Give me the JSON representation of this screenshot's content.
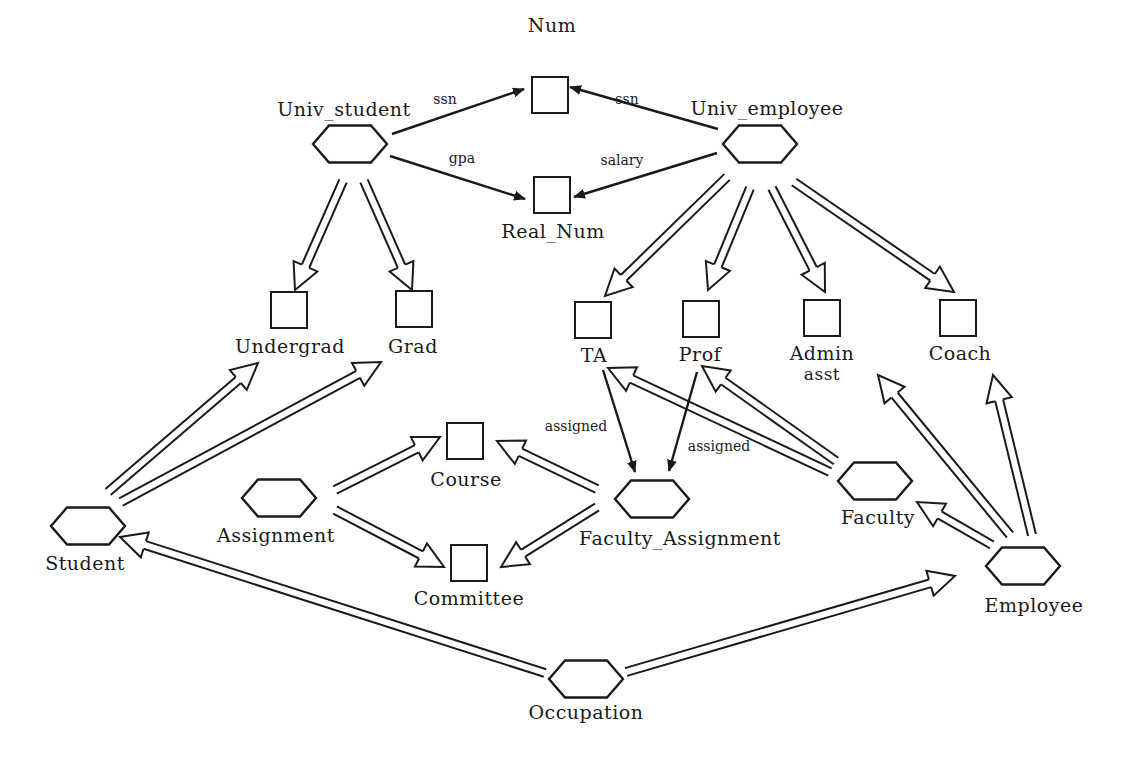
{
  "diagram": {
    "colors": {
      "ink": "#1a1a1a",
      "background": "#ffffff"
    },
    "nodes": [
      {
        "id": "num",
        "label": "Num",
        "shape": "square",
        "x": 550,
        "y": 95,
        "lx": 552,
        "ly": 32
      },
      {
        "id": "real_num",
        "label": "Real_Num",
        "shape": "square",
        "x": 552,
        "y": 195,
        "lx": 553,
        "ly": 238
      },
      {
        "id": "univ_student",
        "label": "Univ_student",
        "shape": "hexagon",
        "x": 350,
        "y": 144,
        "lx": 344,
        "ly": 116
      },
      {
        "id": "univ_employee",
        "label": "Univ_employee",
        "shape": "hexagon",
        "x": 760,
        "y": 144,
        "lx": 767,
        "ly": 115
      },
      {
        "id": "undergrad",
        "label": "Undergrad",
        "shape": "square",
        "x": 289,
        "y": 310,
        "lx": 290,
        "ly": 353
      },
      {
        "id": "grad",
        "label": "Grad",
        "shape": "square",
        "x": 414,
        "y": 309,
        "lx": 413,
        "ly": 353
      },
      {
        "id": "ta",
        "label": "TA",
        "shape": "square",
        "x": 593,
        "y": 320,
        "lx": 594,
        "ly": 362
      },
      {
        "id": "prof",
        "label": "Prof",
        "shape": "square",
        "x": 701,
        "y": 319,
        "lx": 700,
        "ly": 361
      },
      {
        "id": "admin_asst",
        "label": "Admin",
        "label2": "asst",
        "shape": "square",
        "x": 822,
        "y": 318,
        "lx": 822,
        "ly": 360,
        "ly2": 380
      },
      {
        "id": "coach",
        "label": "Coach",
        "shape": "square",
        "x": 958,
        "y": 318,
        "lx": 960,
        "ly": 360
      },
      {
        "id": "course",
        "label": "Course",
        "shape": "square",
        "x": 465,
        "y": 441,
        "lx": 466,
        "ly": 486
      },
      {
        "id": "committee",
        "label": "Committee",
        "shape": "square",
        "x": 469,
        "y": 563,
        "lx": 469,
        "ly": 605
      },
      {
        "id": "assignment",
        "label": "Assignment",
        "shape": "hexagon",
        "x": 279,
        "y": 498,
        "lx": 276,
        "ly": 542
      },
      {
        "id": "student",
        "label": "Student",
        "shape": "hexagon",
        "x": 88,
        "y": 526,
        "lx": 85,
        "ly": 570
      },
      {
        "id": "faculty_assignment",
        "label": "Faculty_Assignment",
        "shape": "hexagon",
        "x": 652,
        "y": 499,
        "lx": 680,
        "ly": 545
      },
      {
        "id": "faculty",
        "label": "Faculty",
        "shape": "hexagon",
        "x": 875,
        "y": 481,
        "lx": 878,
        "ly": 524
      },
      {
        "id": "employee",
        "label": "Employee",
        "shape": "hexagon",
        "x": 1023,
        "y": 566,
        "lx": 1034,
        "ly": 612
      },
      {
        "id": "occupation",
        "label": "Occupation",
        "shape": "hexagon",
        "x": 586,
        "y": 679,
        "lx": 586,
        "ly": 719
      }
    ],
    "edges": [
      {
        "type": "attribute",
        "label": "ssn",
        "from": [
          392,
          134
        ],
        "to": [
          524,
          89
        ],
        "lx": 445,
        "ly": 104
      },
      {
        "type": "attribute",
        "label": "gpa",
        "from": [
          390,
          156
        ],
        "to": [
          525,
          199
        ],
        "lx": 462,
        "ly": 163
      },
      {
        "type": "attribute",
        "label": "ssn",
        "from": [
          718,
          129
        ],
        "to": [
          570,
          87
        ],
        "lx": 627,
        "ly": 104
      },
      {
        "type": "attribute",
        "label": "salary",
        "from": [
          717,
          153
        ],
        "to": [
          574,
          197
        ],
        "lx": 622,
        "ly": 165
      },
      {
        "type": "attribute",
        "label": "assigned",
        "from": [
          603,
          370
        ],
        "to": [
          635,
          472
        ],
        "lx": 576,
        "ly": 431
      },
      {
        "type": "attribute",
        "label": "assigned",
        "from": [
          697,
          372
        ],
        "to": [
          669,
          471
        ],
        "lx": 719,
        "ly": 451
      },
      {
        "type": "isa",
        "from": [
          343,
          181
        ],
        "to": [
          295,
          290
        ]
      },
      {
        "type": "isa",
        "from": [
          364,
          181
        ],
        "to": [
          412,
          290
        ]
      },
      {
        "type": "isa",
        "from": [
          727,
          177
        ],
        "to": [
          605,
          296
        ]
      },
      {
        "type": "isa",
        "from": [
          750,
          188
        ],
        "to": [
          708,
          290
        ]
      },
      {
        "type": "isa",
        "from": [
          772,
          188
        ],
        "to": [
          825,
          292
        ]
      },
      {
        "type": "isa",
        "from": [
          794,
          182
        ],
        "to": [
          954,
          292
        ]
      },
      {
        "type": "isa",
        "from": [
          108,
          492
        ],
        "to": [
          258,
          363
        ]
      },
      {
        "type": "isa",
        "from": [
          121,
          502
        ],
        "to": [
          381,
          362
        ]
      },
      {
        "type": "isa",
        "from": [
          335,
          490
        ],
        "to": [
          440,
          437
        ]
      },
      {
        "type": "isa",
        "from": [
          335,
          510
        ],
        "to": [
          444,
          567
        ]
      },
      {
        "type": "isa",
        "from": [
          597,
          489
        ],
        "to": [
          497,
          441
        ]
      },
      {
        "type": "isa",
        "from": [
          597,
          507
        ],
        "to": [
          501,
          567
        ]
      },
      {
        "type": "isa",
        "from": [
          830,
          472
        ],
        "to": [
          608,
          368
        ]
      },
      {
        "type": "isa",
        "from": [
          836,
          461
        ],
        "to": [
          702,
          366
        ]
      },
      {
        "type": "isa",
        "from": [
          1010,
          535
        ],
        "to": [
          878,
          375
        ]
      },
      {
        "type": "isa",
        "from": [
          1032,
          535
        ],
        "to": [
          993,
          375
        ]
      },
      {
        "type": "isa",
        "from": [
          992,
          545
        ],
        "to": [
          917,
          502
        ]
      },
      {
        "type": "isa",
        "from": [
          545,
          673
        ],
        "to": [
          120,
          537
        ]
      },
      {
        "type": "isa",
        "from": [
          626,
          672
        ],
        "to": [
          955,
          576
        ]
      }
    ]
  }
}
